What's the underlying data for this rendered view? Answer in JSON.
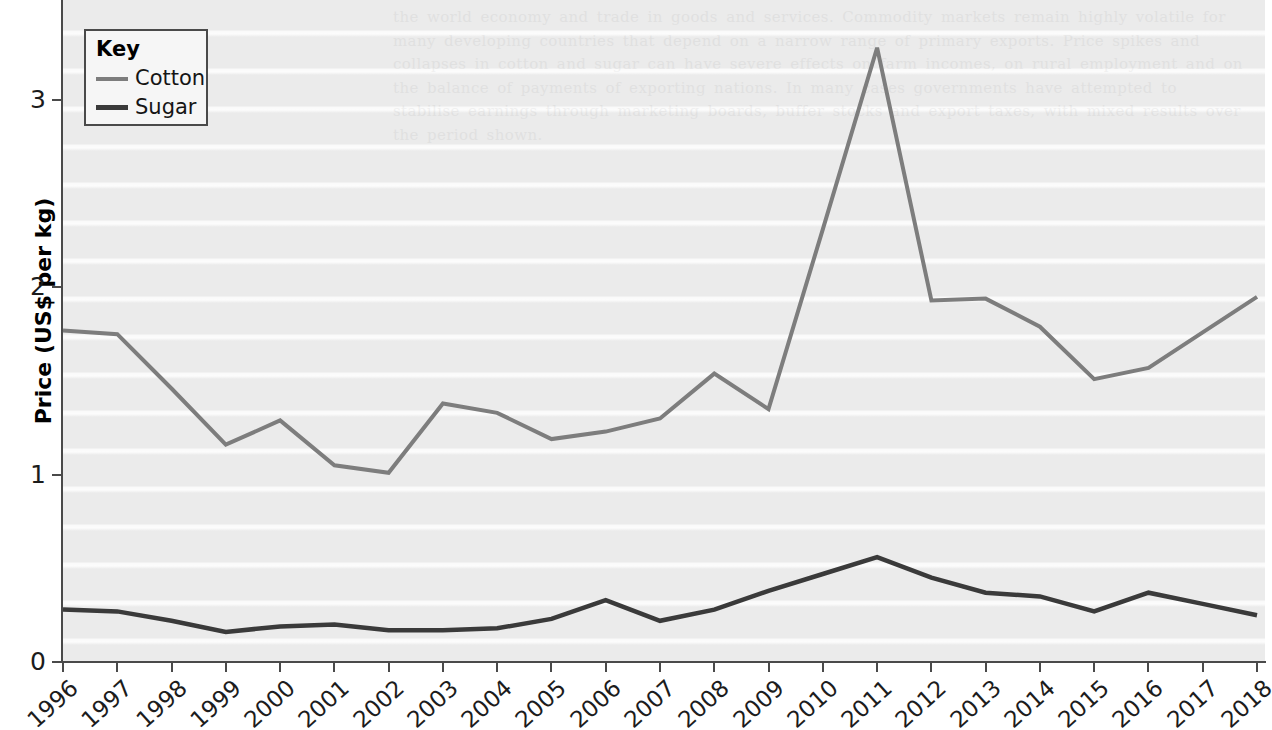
{
  "chart_data": {
    "type": "line",
    "title": "",
    "xlabel": "",
    "ylabel": "Price (US$ per kg)",
    "x": [
      1996,
      1997,
      1998,
      1999,
      2000,
      2001,
      2002,
      2003,
      2004,
      2005,
      2006,
      2007,
      2008,
      2009,
      2010,
      2011,
      2012,
      2013,
      2014,
      2015,
      2016,
      2017,
      2018
    ],
    "categories": [
      "1996",
      "1997",
      "1998",
      "1999",
      "2000",
      "2001",
      "2002",
      "2003",
      "2004",
      "2005",
      "2006",
      "2007",
      "2008",
      "2009",
      "2010",
      "2011",
      "2012",
      "2013",
      "2014",
      "2015",
      "2016",
      "2017",
      "2018"
    ],
    "series": [
      {
        "name": "Cotton",
        "color": "#7d7d7d",
        "values": [
          1.77,
          1.75,
          1.46,
          1.16,
          1.29,
          1.05,
          1.01,
          1.38,
          1.33,
          1.19,
          1.23,
          1.3,
          1.54,
          1.35,
          2.31,
          3.28,
          1.93,
          1.94,
          1.79,
          1.51,
          1.57,
          1.76,
          1.95
        ]
      },
      {
        "name": "Sugar",
        "color": "#3a3a3a",
        "values": [
          0.28,
          0.27,
          0.22,
          0.16,
          0.19,
          0.2,
          0.17,
          0.17,
          0.18,
          0.23,
          0.33,
          0.22,
          0.28,
          0.38,
          0.47,
          0.56,
          0.45,
          0.37,
          0.35,
          0.27,
          0.37,
          0.31,
          0.25
        ]
      }
    ],
    "xlim": [
      1996,
      2018
    ],
    "ylim": [
      0,
      3.4
    ],
    "yticks": [
      0,
      1,
      2,
      3
    ],
    "ytick_labels": [
      "0",
      "1",
      "2",
      "3"
    ],
    "grid": false,
    "legend_position": "top-left"
  },
  "legend": {
    "title": "Key",
    "entries": [
      {
        "label": "Cotton",
        "color": "#7d7d7d"
      },
      {
        "label": "Sugar",
        "color": "#3a3a3a"
      }
    ]
  },
  "axes": {
    "y_title": "Price (US$ per kg)",
    "y_tick_labels": [
      "3",
      "2",
      "1",
      "0"
    ],
    "x_tick_labels": [
      "1996",
      "1997",
      "1998",
      "1999",
      "2000",
      "2001",
      "2002",
      "2003",
      "2004",
      "2005",
      "2006",
      "2007",
      "2008",
      "2009",
      "2010",
      "2011",
      "2012",
      "2013",
      "2014",
      "2015",
      "2016",
      "2017",
      "2018"
    ]
  },
  "background": {
    "plot_fill": "#ebebeb",
    "axis_color": "#4a4a4a",
    "page_fill": "#ffffff",
    "ghost_text": "the world economy and trade in goods and services. Commodity markets remain highly volatile for many developing countries that depend on a narrow range of primary exports. Price spikes and collapses in cotton and sugar can have severe effects on farm incomes, on rural employment and on the balance of payments of exporting nations. In many cases governments have attempted to stabilise earnings through marketing boards, buffer stocks and export taxes, with mixed results over the period shown."
  }
}
